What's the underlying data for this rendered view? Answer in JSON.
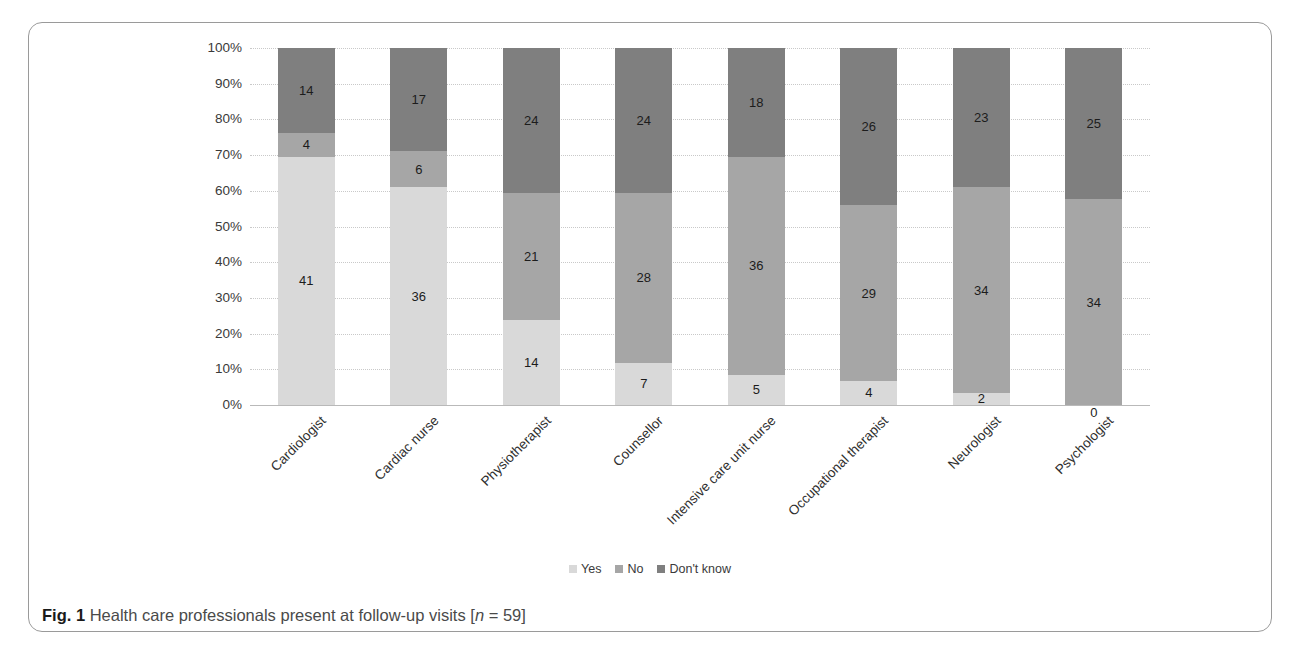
{
  "figure": {
    "caption_label": "Fig. 1",
    "caption_text": "Health care professionals present at follow-up visits",
    "caption_n_open": "[",
    "caption_n_var": "n",
    "caption_n_rest": " = 59]"
  },
  "legend": {
    "position": "bottom-center",
    "items": [
      {
        "label": "Yes",
        "color": "#d9d9d9"
      },
      {
        "label": "No",
        "color": "#a6a6a6"
      },
      {
        "label": "Don't know",
        "color": "#7f7f7f"
      }
    ]
  },
  "axes": {
    "y_ticks": [
      "0%",
      "10%",
      "20%",
      "30%",
      "40%",
      "50%",
      "60%",
      "70%",
      "80%",
      "90%",
      "100%"
    ]
  },
  "chart_data": {
    "type": "bar",
    "stacked": true,
    "normalized": "100%",
    "title": "",
    "xlabel": "",
    "ylabel": "",
    "ylim": [
      0,
      100
    ],
    "grid": true,
    "legend_position": "bottom",
    "total_n": 59,
    "categories": [
      "Cardiologist",
      "Cardiac nurse",
      "Physiotherapist",
      "Counsellor",
      "Intensive care unit nurse",
      "Occupational therapist",
      "Neurologist",
      "Psychologist"
    ],
    "series": [
      {
        "name": "Yes",
        "color": "#d9d9d9",
        "values": [
          41,
          36,
          14,
          7,
          5,
          4,
          2,
          0
        ]
      },
      {
        "name": "No",
        "color": "#a6a6a6",
        "values": [
          4,
          6,
          21,
          28,
          36,
          29,
          34,
          34
        ]
      },
      {
        "name": "Don't know",
        "color": "#7f7f7f",
        "values": [
          14,
          17,
          24,
          24,
          18,
          26,
          23,
          25
        ]
      }
    ]
  }
}
